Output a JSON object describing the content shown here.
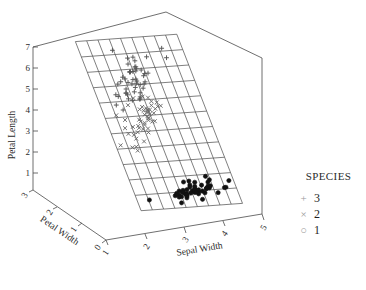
{
  "chart_data": {
    "type": "scatter",
    "title": "",
    "subtitle": "",
    "projection": "3d",
    "xlabel": "Sepal Width",
    "ylabel": "Petal Width",
    "zlabel": "Petal Length",
    "xticks": [
      "1",
      "2",
      "3",
      "4",
      "5"
    ],
    "yticks": [
      "3",
      "2",
      "1",
      "0"
    ],
    "zticks": [
      "1",
      "2",
      "3",
      "4",
      "5",
      "6",
      "7"
    ],
    "xlim": [
      1,
      5
    ],
    "ylim": [
      0,
      3
    ],
    "zlim": [
      0,
      7
    ],
    "grid": true,
    "surface": "regression mesh plane",
    "legend_position": "right",
    "legend_title": "SPECIES",
    "series": [
      {
        "name": "3",
        "marker": "plus",
        "color": "#555555",
        "points": [
          [
            3.3,
            2.5,
            6.0
          ],
          [
            2.7,
            1.9,
            5.1
          ],
          [
            3.0,
            2.1,
            5.9
          ],
          [
            2.9,
            1.8,
            5.6
          ],
          [
            3.0,
            2.2,
            5.8
          ],
          [
            3.0,
            2.1,
            6.6
          ],
          [
            2.5,
            1.7,
            4.5
          ],
          [
            2.9,
            1.8,
            6.3
          ],
          [
            2.5,
            1.8,
            5.8
          ],
          [
            3.6,
            2.5,
            6.1
          ],
          [
            3.2,
            2.0,
            5.1
          ],
          [
            2.7,
            1.9,
            5.3
          ],
          [
            3.0,
            2.1,
            5.5
          ],
          [
            2.5,
            2.0,
            5.0
          ],
          [
            2.8,
            2.4,
            5.1
          ],
          [
            3.2,
            2.3,
            5.3
          ],
          [
            3.0,
            1.8,
            5.5
          ],
          [
            3.8,
            2.2,
            6.7
          ],
          [
            2.6,
            2.3,
            6.9
          ],
          [
            2.2,
            1.5,
            5.0
          ],
          [
            3.2,
            2.3,
            5.7
          ],
          [
            2.8,
            2.0,
            4.9
          ],
          [
            2.8,
            2.0,
            6.7
          ],
          [
            2.7,
            1.8,
            4.9
          ],
          [
            3.3,
            2.1,
            5.7
          ],
          [
            3.2,
            1.8,
            6.0
          ],
          [
            2.8,
            1.8,
            4.8
          ],
          [
            3.0,
            1.8,
            4.9
          ],
          [
            2.8,
            2.1,
            5.6
          ],
          [
            3.0,
            1.6,
            5.8
          ],
          [
            2.8,
            1.9,
            6.1
          ],
          [
            3.8,
            2.0,
            6.4
          ],
          [
            2.8,
            2.2,
            5.6
          ],
          [
            2.8,
            1.5,
            5.1
          ],
          [
            2.6,
            1.4,
            5.6
          ],
          [
            3.0,
            2.3,
            6.1
          ],
          [
            3.4,
            2.4,
            5.6
          ],
          [
            3.1,
            1.8,
            5.5
          ],
          [
            3.0,
            1.8,
            4.8
          ],
          [
            3.1,
            2.1,
            5.4
          ],
          [
            3.1,
            2.4,
            5.6
          ],
          [
            3.1,
            2.3,
            5.1
          ],
          [
            2.7,
            1.9,
            5.1
          ],
          [
            3.2,
            2.3,
            5.9
          ],
          [
            3.3,
            2.5,
            5.7
          ],
          [
            3.0,
            2.3,
            5.2
          ],
          [
            2.5,
            1.9,
            5.0
          ],
          [
            3.0,
            2.0,
            5.2
          ],
          [
            3.4,
            2.3,
            5.4
          ],
          [
            3.0,
            1.8,
            5.1
          ]
        ]
      },
      {
        "name": "2",
        "marker": "cross",
        "color": "#6a6a6a",
        "points": [
          [
            3.2,
            1.4,
            4.7
          ],
          [
            3.2,
            1.5,
            4.5
          ],
          [
            3.1,
            1.5,
            4.9
          ],
          [
            2.3,
            1.3,
            4.0
          ],
          [
            2.8,
            1.5,
            4.6
          ],
          [
            2.8,
            1.3,
            4.5
          ],
          [
            3.3,
            1.6,
            4.7
          ],
          [
            2.4,
            1.0,
            3.3
          ],
          [
            2.9,
            1.3,
            4.6
          ],
          [
            2.7,
            1.4,
            3.9
          ],
          [
            2.0,
            1.0,
            3.5
          ],
          [
            3.0,
            1.5,
            4.2
          ],
          [
            2.2,
            1.0,
            4.0
          ],
          [
            2.9,
            1.4,
            4.7
          ],
          [
            2.9,
            1.3,
            3.6
          ],
          [
            3.1,
            1.4,
            4.4
          ],
          [
            3.0,
            1.5,
            4.5
          ],
          [
            2.7,
            1.0,
            4.1
          ],
          [
            2.2,
            1.5,
            4.5
          ],
          [
            2.5,
            1.1,
            3.9
          ],
          [
            3.2,
            1.8,
            4.8
          ],
          [
            2.8,
            1.3,
            4.0
          ],
          [
            2.5,
            1.5,
            4.9
          ],
          [
            2.8,
            1.2,
            4.7
          ],
          [
            2.9,
            1.3,
            4.3
          ],
          [
            3.0,
            1.4,
            4.4
          ],
          [
            2.8,
            1.4,
            4.8
          ],
          [
            3.0,
            1.7,
            5.0
          ],
          [
            2.9,
            1.5,
            4.5
          ],
          [
            2.6,
            1.0,
            3.5
          ],
          [
            2.4,
            1.1,
            3.8
          ],
          [
            2.4,
            1.0,
            3.7
          ],
          [
            2.7,
            1.2,
            3.9
          ],
          [
            2.7,
            1.6,
            5.1
          ],
          [
            3.0,
            1.5,
            4.5
          ],
          [
            3.4,
            1.6,
            4.5
          ],
          [
            3.1,
            1.5,
            4.7
          ],
          [
            2.3,
            1.3,
            4.4
          ],
          [
            3.0,
            1.3,
            4.1
          ],
          [
            2.5,
            1.3,
            4.0
          ],
          [
            2.6,
            1.2,
            4.4
          ],
          [
            3.0,
            1.4,
            4.6
          ],
          [
            2.6,
            1.2,
            4.0
          ],
          [
            2.3,
            1.0,
            3.3
          ],
          [
            2.7,
            1.3,
            4.2
          ],
          [
            3.0,
            1.2,
            4.2
          ],
          [
            2.9,
            1.3,
            4.2
          ],
          [
            2.9,
            1.3,
            4.3
          ],
          [
            2.5,
            1.1,
            3.0
          ],
          [
            2.8,
            1.3,
            4.1
          ]
        ]
      },
      {
        "name": "1",
        "marker": "circle",
        "color": "#111111",
        "points": [
          [
            3.5,
            0.2,
            1.4
          ],
          [
            3.0,
            0.2,
            1.4
          ],
          [
            3.2,
            0.2,
            1.3
          ],
          [
            3.1,
            0.2,
            1.5
          ],
          [
            3.6,
            0.2,
            1.4
          ],
          [
            3.9,
            0.4,
            1.7
          ],
          [
            3.4,
            0.3,
            1.4
          ],
          [
            3.4,
            0.2,
            1.5
          ],
          [
            2.9,
            0.2,
            1.4
          ],
          [
            3.1,
            0.1,
            1.5
          ],
          [
            3.7,
            0.2,
            1.5
          ],
          [
            3.4,
            0.2,
            1.6
          ],
          [
            3.0,
            0.1,
            1.4
          ],
          [
            3.0,
            0.1,
            1.1
          ],
          [
            4.0,
            0.2,
            1.2
          ],
          [
            4.4,
            0.4,
            1.5
          ],
          [
            3.9,
            0.4,
            1.3
          ],
          [
            3.5,
            0.3,
            1.4
          ],
          [
            3.8,
            0.3,
            1.7
          ],
          [
            3.8,
            0.3,
            1.5
          ],
          [
            3.4,
            0.2,
            1.7
          ],
          [
            3.7,
            0.4,
            1.5
          ],
          [
            3.6,
            0.2,
            1.0
          ],
          [
            3.3,
            0.5,
            1.7
          ],
          [
            3.4,
            0.2,
            1.9
          ],
          [
            3.0,
            0.2,
            1.6
          ],
          [
            3.4,
            0.4,
            1.6
          ],
          [
            3.5,
            0.2,
            1.5
          ],
          [
            3.4,
            0.2,
            1.4
          ],
          [
            3.2,
            0.2,
            1.6
          ],
          [
            3.1,
            0.2,
            1.6
          ],
          [
            3.4,
            0.4,
            1.5
          ],
          [
            4.1,
            0.1,
            1.5
          ],
          [
            4.2,
            0.2,
            1.4
          ],
          [
            3.1,
            0.2,
            1.5
          ],
          [
            3.2,
            0.2,
            1.2
          ],
          [
            3.5,
            0.2,
            1.3
          ],
          [
            3.6,
            0.1,
            1.4
          ],
          [
            3.0,
            0.2,
            1.3
          ],
          [
            3.4,
            0.2,
            1.5
          ],
          [
            3.5,
            0.3,
            1.3
          ],
          [
            2.3,
            0.3,
            1.3
          ],
          [
            3.2,
            0.2,
            1.3
          ],
          [
            3.5,
            0.6,
            1.6
          ],
          [
            3.8,
            0.4,
            1.9
          ],
          [
            3.0,
            0.3,
            1.4
          ],
          [
            3.8,
            0.2,
            1.6
          ],
          [
            3.2,
            0.2,
            1.4
          ],
          [
            3.7,
            0.2,
            1.5
          ],
          [
            3.3,
            0.2,
            1.4
          ]
        ]
      }
    ]
  },
  "axes": {
    "z": {
      "label": "Petal Length",
      "ticks": [
        "7",
        "6",
        "5",
        "4",
        "3",
        "2",
        "1"
      ]
    },
    "y": {
      "label": "Petal Width",
      "ticks": [
        "3",
        "2",
        "1",
        "0"
      ]
    },
    "x": {
      "label": "Sepal Width",
      "ticks": [
        "1",
        "2",
        "3",
        "4",
        "5"
      ]
    }
  },
  "legend": {
    "title": "SPECIES",
    "items": [
      {
        "marker": "+",
        "label": "3"
      },
      {
        "marker": "×",
        "label": "2"
      },
      {
        "marker": "○",
        "label": "1"
      }
    ]
  },
  "colors": {
    "axis": "#4a4a4a",
    "grid": "#3a3a3a",
    "marker_light": "#6a6a6a",
    "marker_dark": "#101010",
    "text": "#2b2b2b",
    "background": "#ffffff"
  }
}
